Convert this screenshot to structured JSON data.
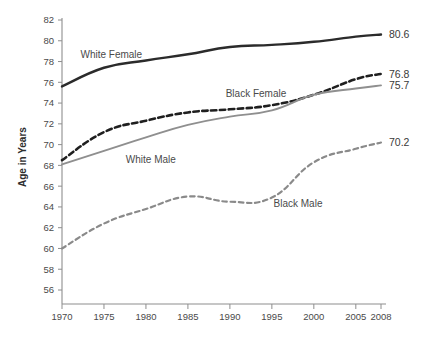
{
  "chart_data": {
    "type": "line",
    "title": "",
    "xlabel": "",
    "ylabel": "Age in Years",
    "ylim": [
      56,
      82
    ],
    "ytick_values": [
      56,
      58,
      60,
      62,
      64,
      66,
      68,
      70,
      72,
      74,
      76,
      78,
      80,
      82
    ],
    "grid": false,
    "legend_position": "inline-annotations",
    "x": [
      1970,
      1975,
      1980,
      1985,
      1990,
      1995,
      2000,
      2005,
      2008
    ],
    "xtick_labels": [
      "1970",
      "1975",
      "1980",
      "1985",
      "1990",
      "1995",
      "2000",
      "2005",
      "2008"
    ],
    "series": [
      {
        "name": "White Female",
        "style": "solid",
        "color": "#2b2b2b",
        "width": 2.4,
        "values": [
          75.6,
          77.4,
          78.1,
          78.7,
          79.4,
          79.6,
          79.9,
          80.4,
          80.6
        ],
        "end_label": "80.6",
        "label_x": 1972.2,
        "label_y": 78.3
      },
      {
        "name": "Black Female",
        "style": "dashed",
        "color": "#1f1f1f",
        "width": 2.6,
        "values": [
          68.5,
          71.2,
          72.3,
          73.1,
          73.4,
          73.8,
          74.8,
          76.3,
          76.8
        ],
        "end_label": "76.8",
        "label_x": 1989.5,
        "label_y": 74.6
      },
      {
        "name": "White Male",
        "style": "solid",
        "color": "#8f8f8f",
        "width": 1.9,
        "values": [
          68.1,
          69.4,
          70.7,
          71.9,
          72.7,
          73.3,
          74.8,
          75.4,
          75.7
        ],
        "end_label": "75.7",
        "label_x": 1977.6,
        "label_y": 68.2
      },
      {
        "name": "Black Male",
        "style": "dashed",
        "color": "#8a8a8a",
        "width": 2.2,
        "values": [
          60.0,
          62.4,
          63.8,
          65.0,
          64.5,
          64.9,
          68.3,
          69.6,
          70.2
        ],
        "end_label": "70.2",
        "label_x": 1995.2,
        "label_y": 64.0
      }
    ]
  }
}
